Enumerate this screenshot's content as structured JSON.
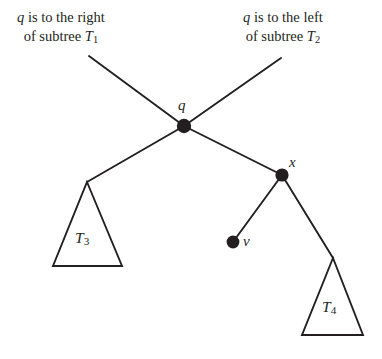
{
  "figure": {
    "type": "binary-search-tree-diagram",
    "background_color": "#ffffff",
    "ink_color": "#231f20",
    "callouts": [
      {
        "id": "left",
        "line1": "q is to the right",
        "line2": "of subtree T",
        "line2_subscript": "1",
        "target_node": "q"
      },
      {
        "id": "right",
        "line1": "q is to the left",
        "line2": "of subtree T",
        "line2_subscript": "2",
        "target_node": "q"
      }
    ],
    "nodes": [
      {
        "id": "q",
        "label": "q",
        "x": 184,
        "y": 126,
        "filled": true
      },
      {
        "id": "x",
        "label": "x",
        "x": 282,
        "y": 175,
        "filled": true
      },
      {
        "id": "v",
        "label": "v",
        "x": 233,
        "y": 242,
        "filled": true
      }
    ],
    "subtrees": [
      {
        "id": "t3",
        "label": "T",
        "subscript": "3",
        "apex_x": 87,
        "apex_y": 182,
        "base_left_x": 53,
        "base_right_x": 122,
        "base_y": 266
      },
      {
        "id": "t4",
        "label": "T",
        "subscript": "4",
        "apex_x": 333,
        "apex_y": 258,
        "base_left_x": 302,
        "base_right_x": 363,
        "base_y": 335
      }
    ],
    "edges": [
      {
        "id": "callout-left-line",
        "from": "callout-left",
        "to": "q",
        "x1": 89,
        "y1": 56,
        "x2": 184,
        "y2": 126
      },
      {
        "id": "callout-right-line",
        "from": "callout-right",
        "to": "q",
        "x1": 281,
        "y1": 58,
        "x2": 184,
        "y2": 126
      },
      {
        "id": "q-to-t3",
        "from": "q",
        "to": "t3",
        "x1": 184,
        "y1": 126,
        "x2": 87,
        "y2": 182
      },
      {
        "id": "q-to-x",
        "from": "q",
        "to": "x",
        "x1": 184,
        "y1": 126,
        "x2": 282,
        "y2": 175
      },
      {
        "id": "x-to-v",
        "from": "x",
        "to": "v",
        "x1": 282,
        "y1": 175,
        "x2": 233,
        "y2": 242
      },
      {
        "id": "x-to-t4",
        "from": "x",
        "to": "t4",
        "x1": 282,
        "y1": 175,
        "x2": 333,
        "y2": 258
      }
    ]
  }
}
